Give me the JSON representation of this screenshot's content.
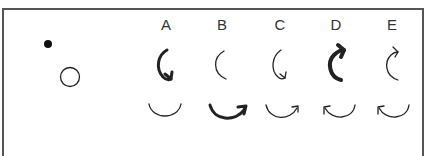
{
  "figure": {
    "labels": [
      "A",
      "B",
      "C",
      "D",
      "E"
    ],
    "reference": {
      "dot": "filled-dot",
      "circle": "hollow-circle"
    },
    "columns": [
      {
        "label": "A",
        "top_arrow": "counterclockwise-arc-arrow-down",
        "top_weight": "bold",
        "bottom_arc": "plain-lower-arc",
        "bottom_weight": "thin"
      },
      {
        "label": "B",
        "top_arrow": "plain-left-arc",
        "top_weight": "thin",
        "bottom_arc": "lower-arc-arrow-right-up",
        "bottom_weight": "bold"
      },
      {
        "label": "C",
        "top_arrow": "counterclockwise-arc-arrow-down",
        "top_weight": "thin",
        "bottom_arc": "lower-arc-arrow-right-up",
        "bottom_weight": "thin"
      },
      {
        "label": "D",
        "top_arrow": "clockwise-arc-arrow-up",
        "top_weight": "bold",
        "bottom_arc": "lower-arc-arrow-left-up",
        "bottom_weight": "thin"
      },
      {
        "label": "E",
        "top_arrow": "clockwise-arc-arrow-up",
        "top_weight": "thin",
        "bottom_arc": "lower-arc-arrow-left-up",
        "bottom_weight": "thin"
      }
    ],
    "colors": {
      "stroke": "#222222",
      "frame": "#555555",
      "label": "#333333"
    }
  }
}
